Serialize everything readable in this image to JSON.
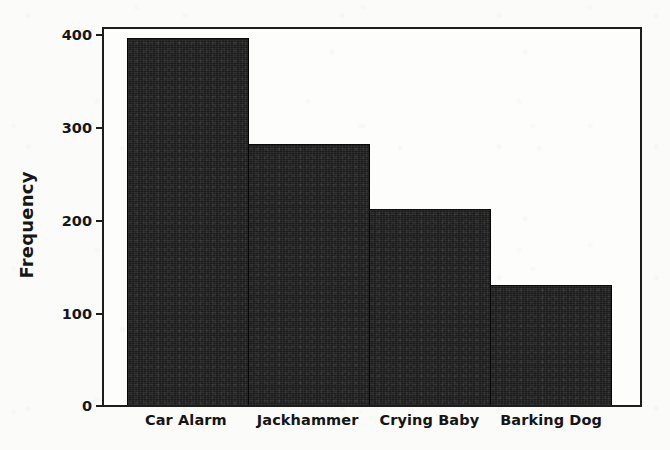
{
  "chart_data": {
    "type": "bar",
    "title": "",
    "xlabel": "",
    "ylabel": "Frequency",
    "categories": [
      "Car Alarm",
      "Jackhammer",
      "Crying Baby",
      "Barking Dog"
    ],
    "values": [
      390,
      278,
      208,
      128
    ],
    "ylim": [
      0,
      400
    ],
    "yticks": [
      0,
      100,
      200,
      300,
      400
    ],
    "ytick_labels": [
      "0",
      "100",
      "200",
      "300",
      "400"
    ],
    "grid": false,
    "legend": false,
    "bar_color": "#1b1b1b",
    "axis_color": "#1d1d1d",
    "background_color": "#fbfbf9",
    "bars_adjacent": true
  },
  "axes": {
    "y_title": "Frequency",
    "y_tick_0": "0",
    "y_tick_1": "100",
    "y_tick_2": "200",
    "y_tick_3": "300",
    "y_tick_4": "400"
  },
  "bars": [
    {
      "label": "Car Alarm",
      "value": 390
    },
    {
      "label": "Jackhammer",
      "value": 278
    },
    {
      "label": "Crying Baby",
      "value": 208
    },
    {
      "label": "Barking Dog",
      "value": 128
    }
  ]
}
